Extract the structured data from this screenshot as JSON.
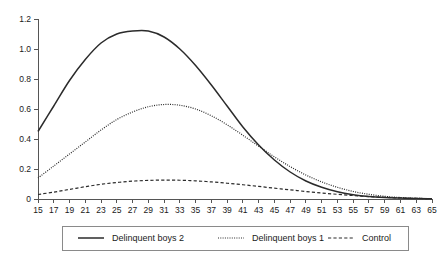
{
  "chart_data": {
    "type": "line",
    "title": "",
    "subtitle": "",
    "xlabel": "",
    "ylabel": "",
    "xlim": [
      15,
      65
    ],
    "ylim": [
      0,
      1.2
    ],
    "grid": false,
    "legend_position": "bottom",
    "y_ticks": [
      "0",
      "0.2",
      "0.4",
      "0.6",
      "0.8",
      "1.0",
      "1.2"
    ],
    "y_tick_values": [
      0,
      0.2,
      0.4,
      0.6,
      0.8,
      1.0,
      1.2
    ],
    "x_ticks": [
      "15",
      "17",
      "19",
      "21",
      "23",
      "25",
      "27",
      "29",
      "31",
      "33",
      "35",
      "37",
      "39",
      "41",
      "43",
      "45",
      "47",
      "49",
      "51",
      "53",
      "55",
      "57",
      "59",
      "61",
      "63",
      "65"
    ],
    "x_tick_values": [
      15,
      17,
      19,
      21,
      23,
      25,
      27,
      29,
      31,
      33,
      35,
      37,
      39,
      41,
      43,
      45,
      47,
      49,
      51,
      53,
      55,
      57,
      59,
      61,
      63,
      65
    ],
    "x": [
      15,
      17,
      19,
      21,
      23,
      25,
      27,
      29,
      31,
      33,
      35,
      37,
      39,
      41,
      43,
      45,
      47,
      49,
      51,
      53,
      55,
      57,
      59,
      61,
      63,
      65
    ],
    "series": [
      {
        "name": "Delinquent boys 2",
        "style": "solid",
        "color": "#2b2b2b",
        "values": [
          0.45,
          0.62,
          0.79,
          0.93,
          1.04,
          1.1,
          1.12,
          1.12,
          1.08,
          1.0,
          0.89,
          0.76,
          0.62,
          0.48,
          0.36,
          0.26,
          0.18,
          0.12,
          0.078,
          0.048,
          0.029,
          0.017,
          0.01,
          0.006,
          0.003,
          0.002
        ]
      },
      {
        "name": "Delinquent boys 1",
        "style": "dotted",
        "color": "#2b2b2b",
        "values": [
          0.14,
          0.22,
          0.3,
          0.38,
          0.46,
          0.53,
          0.58,
          0.615,
          0.63,
          0.625,
          0.6,
          0.555,
          0.495,
          0.425,
          0.352,
          0.281,
          0.216,
          0.16,
          0.114,
          0.078,
          0.05,
          0.031,
          0.018,
          0.01,
          0.005,
          0.002
        ]
      },
      {
        "name": "Control",
        "style": "dashed",
        "color": "#2b2b2b",
        "values": [
          0.03,
          0.046,
          0.064,
          0.082,
          0.098,
          0.11,
          0.119,
          0.124,
          0.126,
          0.125,
          0.121,
          0.114,
          0.105,
          0.095,
          0.084,
          0.072,
          0.061,
          0.05,
          0.04,
          0.031,
          0.023,
          0.016,
          0.011,
          0.007,
          0.004,
          0.002
        ]
      }
    ]
  },
  "legend": {
    "items": [
      {
        "label": "Delinquent boys 2",
        "style": "solid"
      },
      {
        "label": "Delinquent boys 1",
        "style": "dotted"
      },
      {
        "label": "Control",
        "style": "dashed"
      }
    ]
  }
}
